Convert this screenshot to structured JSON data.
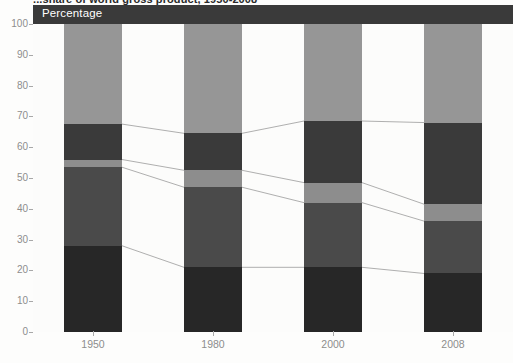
{
  "title": "...share of world gross product, 1950-2008",
  "axis_header": {
    "label": "Percentage"
  },
  "colors": {
    "segment_1": "#272727",
    "segment_2": "#4a4a4a",
    "segment_3": "#8d8d8d",
    "segment_4": "#3a3a3a",
    "segment_5": "#969696",
    "header_band": "#3a3a3a",
    "axis": "#a8a8a8",
    "tick_text": "#8d8d8d",
    "connector": "#9a9a9a",
    "plot_background": "#fcfcfb"
  },
  "chart_data": {
    "type": "bar",
    "title": "...share of world gross product, 1950-2008",
    "xlabel": "",
    "ylabel": "Percentage",
    "ylim": [
      0,
      100
    ],
    "yticks": [
      0,
      10,
      20,
      30,
      40,
      50,
      60,
      70,
      80,
      90,
      100
    ],
    "ytick_labels": [
      "0",
      "10",
      "20",
      "30",
      "40",
      "50",
      "60",
      "70",
      "80",
      "90",
      "100"
    ],
    "categories": [
      "1950",
      "1980",
      "2000",
      "2008"
    ],
    "stacked": true,
    "normalized_to_100": true,
    "grid": false,
    "legend": "none",
    "connectors": true,
    "series": [
      {
        "name": "segment_1",
        "order": 1,
        "color": "#272727",
        "values": [
          28.0,
          21.0,
          21.0,
          19.0
        ]
      },
      {
        "name": "segment_2",
        "order": 2,
        "color": "#4a4a4a",
        "values": [
          25.5,
          26.0,
          21.0,
          17.0
        ]
      },
      {
        "name": "segment_3",
        "order": 3,
        "color": "#8d8d8d",
        "values": [
          2.5,
          5.5,
          6.5,
          5.5
        ]
      },
      {
        "name": "segment_4",
        "order": 4,
        "color": "#3a3a3a",
        "values": [
          11.5,
          12.0,
          20.0,
          26.5
        ]
      },
      {
        "name": "segment_5",
        "order": 5,
        "color": "#969696",
        "values": [
          32.5,
          35.5,
          31.5,
          32.0
        ]
      }
    ],
    "cumulative_boundaries": [
      {
        "category": "1950",
        "edges": [
          0,
          28.0,
          53.5,
          56.0,
          67.5,
          100
        ]
      },
      {
        "category": "1980",
        "edges": [
          0,
          21.0,
          47.0,
          52.5,
          64.5,
          100
        ]
      },
      {
        "category": "2000",
        "edges": [
          0,
          21.0,
          42.0,
          48.5,
          68.5,
          100
        ]
      },
      {
        "category": "2008",
        "edges": [
          0,
          19.0,
          36.0,
          41.5,
          68.0,
          100
        ]
      }
    ]
  }
}
